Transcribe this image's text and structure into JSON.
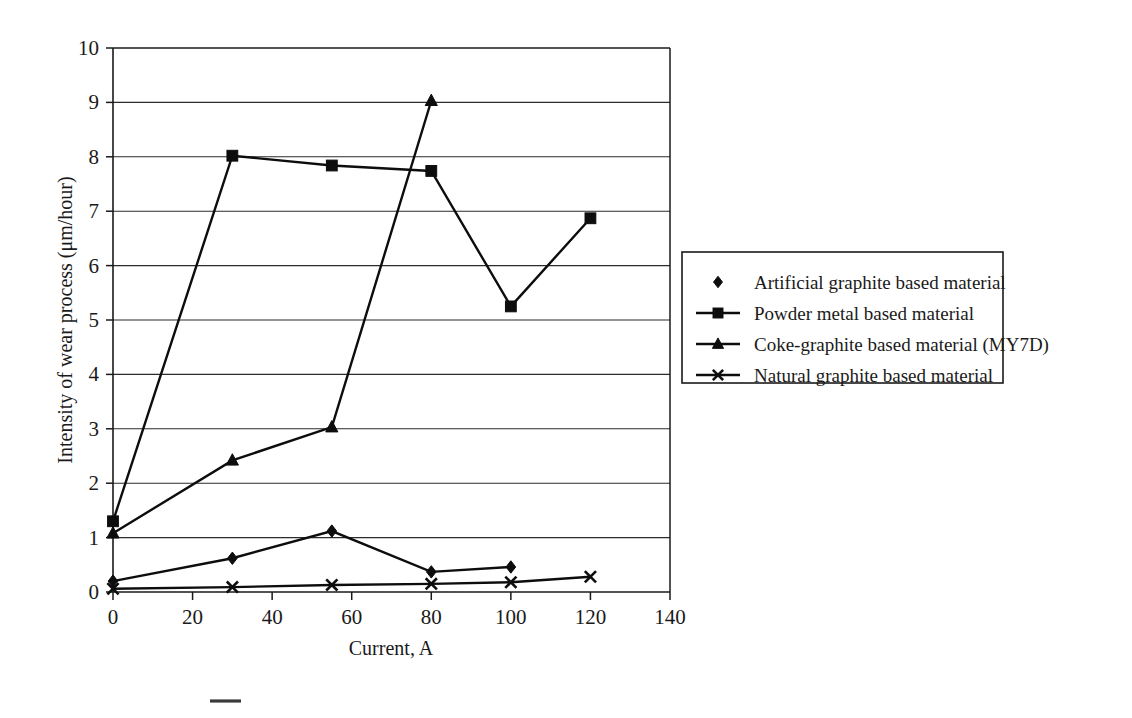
{
  "chart_data": {
    "type": "line",
    "title": "",
    "subtitle": "",
    "xlabel": "Current, A",
    "ylabel": "Intensity of wear process (μm/hour)",
    "xlim": [
      0,
      140
    ],
    "ylim": [
      0,
      10
    ],
    "xticks": [
      0,
      20,
      40,
      60,
      80,
      100,
      120,
      140
    ],
    "xtick_labels": [
      "0",
      "20",
      "40",
      "60",
      "80",
      "100",
      "120",
      "140"
    ],
    "yticks": [
      0,
      1,
      2,
      3,
      4,
      5,
      6,
      7,
      8,
      9,
      10
    ],
    "ytick_labels": [
      "0",
      "1",
      "2",
      "3",
      "4",
      "5",
      "6",
      "7",
      "8",
      "9",
      "10"
    ],
    "grid": "horizontal",
    "legend_position": "right",
    "series": [
      {
        "name": "Artificial graphite based material",
        "marker": "diamond",
        "x": [
          0,
          30,
          55,
          80,
          100
        ],
        "values": [
          0.2,
          0.62,
          1.12,
          0.37,
          0.46
        ]
      },
      {
        "name": "Powder metal based material",
        "marker": "square",
        "x": [
          0,
          30,
          55,
          80,
          100,
          120
        ],
        "values": [
          1.3,
          8.02,
          7.84,
          7.74,
          5.25,
          6.87
        ]
      },
      {
        "name": "Coke-graphite based material (MY7D)",
        "marker": "triangle",
        "x": [
          0,
          30,
          55,
          80
        ],
        "values": [
          1.08,
          2.42,
          3.03,
          9.03
        ]
      },
      {
        "name": "Natural graphite based material",
        "marker": "cross-x",
        "x": [
          0,
          30,
          55,
          80,
          100,
          120
        ],
        "values": [
          0.06,
          0.09,
          0.13,
          0.15,
          0.18,
          0.28
        ]
      }
    ]
  },
  "legend": {
    "items": [
      {
        "label": "Artificial graphite based material",
        "marker": "diamond",
        "show_line": false
      },
      {
        "label": "Powder metal based material",
        "marker": "square",
        "show_line": true
      },
      {
        "label": "Coke-graphite based material (MY7D)",
        "marker": "triangle",
        "show_line": true
      },
      {
        "label": "Natural graphite based material",
        "marker": "cross-x",
        "show_line": true
      }
    ]
  },
  "colors": {
    "ink": "#0d0d0d",
    "grid": "#2b2b2b",
    "background": "#ffffff"
  }
}
